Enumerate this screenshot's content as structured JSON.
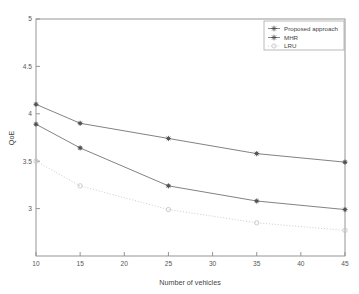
{
  "chart_data": {
    "type": "line",
    "title": "",
    "xlabel": "Number of vehicles",
    "ylabel": "QoE",
    "xlim": [
      10,
      45
    ],
    "ylim": [
      2.5,
      5
    ],
    "xticks": [
      "10",
      "15",
      "20",
      "25",
      "30",
      "35",
      "40",
      "45"
    ],
    "xtick_values": [
      10,
      15,
      20,
      25,
      30,
      35,
      40,
      45
    ],
    "yticks": [
      "3",
      "3.5",
      "4",
      "4.5",
      "5"
    ],
    "ytick_values": [
      3,
      3.5,
      4,
      4.5,
      5
    ],
    "grid": false,
    "legend_position": "top-right",
    "x": [
      10,
      15,
      25,
      35,
      45
    ],
    "series": [
      {
        "name": "Proposed approach",
        "values": [
          4.1,
          3.9,
          3.74,
          3.58,
          3.49
        ],
        "style": "solid",
        "marker": "star",
        "color": "#6b6b6b"
      },
      {
        "name": "MHR",
        "values": [
          3.89,
          3.64,
          3.24,
          3.08,
          2.99
        ],
        "style": "solid",
        "marker": "star",
        "color": "#6b6b6b"
      },
      {
        "name": "LRU",
        "values": [
          3.5,
          3.24,
          2.99,
          2.85,
          2.77
        ],
        "style": "dotted",
        "marker": "circle",
        "color": "#c8c8c8"
      }
    ]
  },
  "legend": {
    "entries": [
      {
        "label": "Proposed approach"
      },
      {
        "label": "MHR"
      },
      {
        "label": "LRU"
      }
    ]
  },
  "axes": {
    "x_title": "Number of vehicles",
    "y_title": "QoE"
  }
}
